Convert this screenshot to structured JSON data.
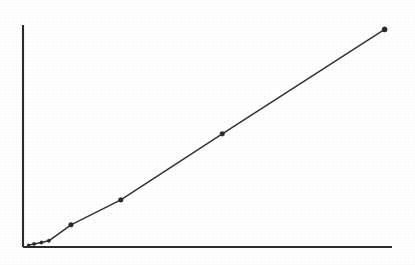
{
  "figure": {
    "title": "",
    "background_color": "#ffffff",
    "ink_color": "#2b2b2b",
    "width": 415,
    "height": 265
  },
  "chart_data": {
    "type": "line",
    "title": "",
    "subtitle": "",
    "xlabel": "",
    "ylabel": "",
    "legend": [],
    "legend_position": "none",
    "grid": false,
    "xlim": [
      0,
      100
    ],
    "ylim": [
      0,
      100
    ],
    "xticks": [],
    "yticks": [],
    "xticklabels": [],
    "yticklabels": [],
    "annotations": [],
    "series": [
      {
        "name": "measured",
        "marker": "filled-circle",
        "line_style": "solid",
        "color": "#2a2a2a",
        "x": [
          1.5,
          3.0,
          5.0,
          7.0,
          13.0,
          26.5,
          54.0,
          98.0
        ],
        "y": [
          0.8,
          1.4,
          2.0,
          2.8,
          10.0,
          21.2,
          51.0,
          98.0
        ]
      }
    ]
  },
  "axes": {
    "x_axis_name": "x-axis",
    "y_axis_name": "y-axis",
    "x_axis_start_px": [
      23,
      247
    ],
    "x_axis_end_px": [
      392,
      247
    ],
    "y_axis_start_px": [
      23,
      247
    ],
    "y_axis_end_px": [
      23,
      25
    ]
  },
  "plot_box_px": {
    "left": 23,
    "right": 392,
    "top": 25,
    "bottom": 247
  }
}
